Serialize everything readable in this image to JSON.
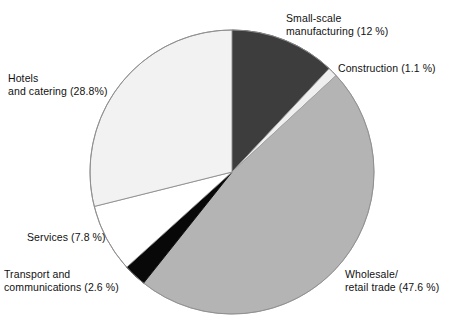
{
  "chart_data": {
    "type": "pie",
    "title": "",
    "subtitle": "",
    "xlabel": "",
    "ylabel": "",
    "legend_position": "none",
    "grid": false,
    "units": "percent",
    "total": 100,
    "start_angle_deg": 0,
    "direction": "clockwise",
    "center": {
      "x": 232,
      "y": 172
    },
    "radius": 142,
    "categories": [
      "Small-scale manufacturing",
      "Construction",
      "Wholesale/retail trade",
      "Transport and communications",
      "Services",
      "Hotels and catering"
    ],
    "values": [
      12,
      1.1,
      47.6,
      2.6,
      7.8,
      28.8
    ],
    "slices": [
      {
        "name": "small-scale-manufacturing",
        "label_line1": "Small-scale",
        "label_line2": "manufacturing (12 %)",
        "value": 12,
        "value_text": "12 %",
        "color": "#3d3d3d",
        "stroke": "#4a4a4a",
        "start_deg": 0,
        "end_deg": 43.2
      },
      {
        "name": "construction",
        "label_line1": "Construction (1.1 %)",
        "label_line2": "",
        "value": 1.1,
        "value_text": "1.1 %",
        "color": "#efefef",
        "stroke": "#9a9a9a",
        "start_deg": 43.2,
        "end_deg": 47.16
      },
      {
        "name": "wholesale-retail-trade",
        "label_line1": "Wholesale/",
        "label_line2": "retail trade (47.6 %)",
        "value": 47.6,
        "value_text": "47.6 %",
        "color": "#b4b4b4",
        "stroke": "#a2a2a2",
        "start_deg": 47.16,
        "end_deg": 218.52
      },
      {
        "name": "transport-and-communications",
        "label_line1": "Transport and",
        "label_line2": "communications (2.6 %)",
        "value": 2.6,
        "value_text": "2.6 %",
        "color": "#080808",
        "stroke": "#080808",
        "start_deg": 218.52,
        "end_deg": 227.88
      },
      {
        "name": "services",
        "label_line1": "Services (7.8 %)",
        "label_line2": "",
        "value": 7.8,
        "value_text": "7.8 %",
        "color": "#ffffff",
        "stroke": "#8d8d8d",
        "start_deg": 227.88,
        "end_deg": 255.96
      },
      {
        "name": "hotels-and-catering",
        "label_line1": "Hotels",
        "label_line2": "and catering (28.8%)",
        "value": 28.8,
        "value_text": "28.8%",
        "color": "#f2f2f2",
        "stroke": "#8d8d8d",
        "start_deg": 255.96,
        "end_deg": 360
      }
    ]
  },
  "labels": {
    "manufacturing_line1": "Small-scale",
    "manufacturing_line2": "manufacturing (12 %)",
    "construction": "Construction (1.1 %)",
    "hotels_line1": "Hotels",
    "hotels_line2": "and catering (28.8%)",
    "services": "Services (7.8 %)",
    "transport_line1": "Transport and",
    "transport_line2": "communications (2.6 %)",
    "wholesale_line1": "Wholesale/",
    "wholesale_line2": "retail trade (47.6 %)"
  },
  "colors": {
    "background": "#ffffff",
    "text": "#111111",
    "manufacturing": "#3d3d3d",
    "construction": "#efefef",
    "wholesale": "#b4b4b4",
    "transport": "#080808",
    "services": "#ffffff",
    "hotels": "#f2f2f2",
    "outline": "#8d8d8d"
  }
}
